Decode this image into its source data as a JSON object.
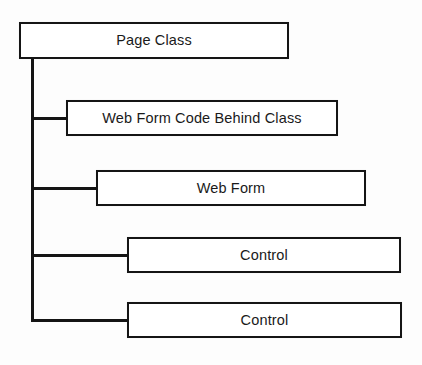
{
  "diagram": {
    "type": "tree-bracket",
    "background_color": "#fdfdfd",
    "line_color": "#141414",
    "box_fill_color": "#ffffff",
    "box_border_color": "#151515",
    "text_color": "#1a1a1a",
    "root": {
      "label": "Page Class",
      "x": 19,
      "y": 22,
      "width": 270,
      "height": 37
    },
    "trunk": {
      "x": 31,
      "top": 57,
      "bottom": 322,
      "thickness": 3
    },
    "children": [
      {
        "label": "Web Form Code Behind Class",
        "x": 66,
        "y": 100,
        "width": 272,
        "height": 36,
        "connector_y": 118,
        "connector_from_x": 31
      },
      {
        "label": "Web Form",
        "x": 96,
        "y": 170,
        "width": 270,
        "height": 36,
        "connector_y": 188,
        "connector_from_x": 31
      },
      {
        "label": "Control",
        "x": 127,
        "y": 237,
        "width": 274,
        "height": 36,
        "connector_y": 255,
        "connector_from_x": 31
      },
      {
        "label": "Control",
        "x": 127,
        "y": 302,
        "width": 275,
        "height": 36,
        "connector_y": 320,
        "connector_from_x": 31
      }
    ]
  }
}
